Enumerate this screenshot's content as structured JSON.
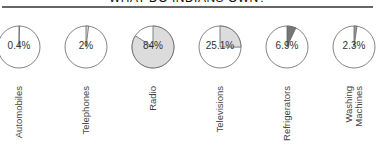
{
  "header": {
    "title": "WHAT DO INDIANS OWN?"
  },
  "colors": {
    "light_slice": "#dcdcdc",
    "dark_slice": "#767676",
    "outline": "#666666",
    "empty": "#ffffff"
  },
  "chart_data": {
    "type": "pie",
    "title": "WHAT DO INDIANS OWN?",
    "categories": [
      "Automobiles",
      "Telephones",
      "Radio",
      "Televisions",
      "Refrigerators",
      "Washing Machines"
    ],
    "values": [
      0.4,
      2,
      84,
      25.1,
      6.9,
      2.3
    ],
    "unit": "%",
    "items": [
      {
        "label": "Automobiles",
        "label_lines": [
          "Automobiles"
        ],
        "value": 0.4,
        "display": "0.4%",
        "color": "#bbbbbb",
        "cx": 19
      },
      {
        "label": "Telephones",
        "label_lines": [
          "Telephones"
        ],
        "value": 2,
        "display": "2%",
        "color": "#dcdcdc",
        "cx": 86
      },
      {
        "label": "Radio",
        "label_lines": [
          "Radio"
        ],
        "value": 84,
        "display": "84%",
        "color": "#dcdcdc",
        "cx": 153
      },
      {
        "label": "Televisions",
        "label_lines": [
          "Televisions"
        ],
        "value": 25.1,
        "display": "25.1%",
        "color": "#dcdcdc",
        "cx": 220
      },
      {
        "label": "Refrigerators",
        "label_lines": [
          "Refrigerators"
        ],
        "value": 6.9,
        "display": "6.9%",
        "color": "#767676",
        "cx": 287
      },
      {
        "label": "Washing Machines",
        "label_lines": [
          "Washing",
          "Machines"
        ],
        "value": 2.3,
        "display": "2.3%",
        "color": "#999999",
        "cx": 354
      }
    ]
  }
}
